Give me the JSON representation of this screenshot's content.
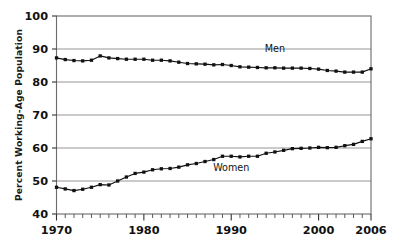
{
  "chart_data": {
    "type": "line",
    "title": "",
    "subtitle": "",
    "xlabel": "",
    "ylabel": "Percent Working-Age Population",
    "xlim": [
      1970,
      2006
    ],
    "ylim": [
      40,
      100
    ],
    "grid": true,
    "grid_axis": "y",
    "legend": "inline-annotations",
    "ytick_labels": [
      "40",
      "50",
      "60",
      "70",
      "80",
      "90",
      "100"
    ],
    "ytick_values": [
      40,
      50,
      60,
      70,
      80,
      90,
      100
    ],
    "xtick_labels": [
      "1970",
      "1980",
      "1990",
      "2000",
      "2006"
    ],
    "xtick_values": [
      1970,
      1980,
      1990,
      2000,
      2006
    ],
    "x_minor_tick_interval": 1,
    "annotations": [
      {
        "text": "Men",
        "x": 1995,
        "y": 89.2
      },
      {
        "text": "Women",
        "x": 1990,
        "y": 53.0
      }
    ],
    "x": [
      1970,
      1971,
      1972,
      1973,
      1974,
      1975,
      1976,
      1977,
      1978,
      1979,
      1980,
      1981,
      1982,
      1983,
      1984,
      1985,
      1986,
      1987,
      1988,
      1989,
      1990,
      1991,
      1992,
      1993,
      1994,
      1995,
      1996,
      1997,
      1998,
      1999,
      2000,
      2001,
      2002,
      2003,
      2004,
      2005,
      2006
    ],
    "series": [
      {
        "name": "Men",
        "color": "#111111",
        "marker": "square",
        "values": [
          87.3,
          86.8,
          86.5,
          86.4,
          86.6,
          87.9,
          87.3,
          87.1,
          86.9,
          86.9,
          86.9,
          86.6,
          86.6,
          86.4,
          86.0,
          85.6,
          85.5,
          85.4,
          85.2,
          85.3,
          85.0,
          84.6,
          84.5,
          84.4,
          84.3,
          84.3,
          84.2,
          84.2,
          84.2,
          84.1,
          83.9,
          83.5,
          83.3,
          83.0,
          83.0,
          83.0,
          84.0
        ]
      },
      {
        "name": "Women",
        "color": "#111111",
        "marker": "square",
        "values": [
          48.1,
          47.6,
          47.1,
          47.5,
          48.1,
          48.9,
          48.8,
          50.0,
          51.2,
          52.3,
          52.7,
          53.4,
          53.7,
          53.8,
          54.2,
          54.9,
          55.3,
          55.9,
          56.5,
          57.5,
          57.5,
          57.3,
          57.5,
          57.5,
          58.4,
          58.8,
          59.3,
          59.8,
          59.9,
          60.0,
          60.2,
          60.1,
          60.2,
          60.7,
          61.1,
          62.0,
          62.8
        ]
      }
    ]
  }
}
